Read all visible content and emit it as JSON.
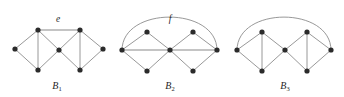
{
  "figure": {
    "width": 344,
    "height": 97,
    "background_color": "#ffffff",
    "edge_color": "#8c8c8c",
    "highlight_edge_color": "#b0b0b0",
    "vertex_color": "#2b2b2b",
    "label_color": "#262626"
  },
  "graphs": [
    {
      "id": "B1",
      "label": "B",
      "label_sub": "1",
      "label_x": 57,
      "label_y": 89,
      "vertices": [
        {
          "name": "b1-left",
          "x": 15,
          "y": 49
        },
        {
          "name": "b1-top-left",
          "x": 38,
          "y": 30
        },
        {
          "name": "b1-bottom-left",
          "x": 38,
          "y": 70
        },
        {
          "name": "b1-center",
          "x": 59,
          "y": 50
        },
        {
          "name": "b1-top-right",
          "x": 80,
          "y": 30
        },
        {
          "name": "b1-bottom-right",
          "x": 80,
          "y": 70
        },
        {
          "name": "b1-right",
          "x": 103,
          "y": 49
        }
      ],
      "edges": [
        {
          "from": 0,
          "to": 1,
          "kind": "line"
        },
        {
          "from": 0,
          "to": 2,
          "kind": "line"
        },
        {
          "from": 1,
          "to": 2,
          "kind": "line"
        },
        {
          "from": 1,
          "to": 3,
          "kind": "line"
        },
        {
          "from": 2,
          "to": 3,
          "kind": "line"
        },
        {
          "from": 3,
          "to": 4,
          "kind": "line"
        },
        {
          "from": 3,
          "to": 5,
          "kind": "line"
        },
        {
          "from": 4,
          "to": 5,
          "kind": "line"
        },
        {
          "from": 4,
          "to": 6,
          "kind": "line"
        },
        {
          "from": 5,
          "to": 6,
          "kind": "line"
        },
        {
          "from": 1,
          "to": 4,
          "kind": "highlight"
        }
      ],
      "edge_labels": [
        {
          "name": "edge-label-e",
          "text": "e",
          "x": 58,
          "y": 22
        }
      ],
      "arcs": []
    },
    {
      "id": "B2",
      "label": "B",
      "label_sub": "2",
      "label_x": 170,
      "label_y": 89,
      "vertices": [
        {
          "name": "b2-left",
          "x": 122,
          "y": 50
        },
        {
          "name": "b2-top-left",
          "x": 147,
          "y": 32
        },
        {
          "name": "b2-bottom-left",
          "x": 147,
          "y": 71
        },
        {
          "name": "b2-center",
          "x": 170,
          "y": 50
        },
        {
          "name": "b2-top-right",
          "x": 193,
          "y": 32
        },
        {
          "name": "b2-bottom-right",
          "x": 193,
          "y": 71
        },
        {
          "name": "b2-right",
          "x": 217,
          "y": 50
        }
      ],
      "edges": [
        {
          "from": 0,
          "to": 1,
          "kind": "line"
        },
        {
          "from": 0,
          "to": 2,
          "kind": "line"
        },
        {
          "from": 1,
          "to": 3,
          "kind": "line"
        },
        {
          "from": 2,
          "to": 3,
          "kind": "line"
        },
        {
          "from": 3,
          "to": 4,
          "kind": "line"
        },
        {
          "from": 3,
          "to": 5,
          "kind": "line"
        },
        {
          "from": 4,
          "to": 6,
          "kind": "line"
        },
        {
          "from": 5,
          "to": 6,
          "kind": "line"
        },
        {
          "from": 0,
          "to": 3,
          "kind": "highlight"
        },
        {
          "from": 3,
          "to": 6,
          "kind": "highlight"
        }
      ],
      "arcs": [
        {
          "name": "arc-edge-f",
          "from": 0,
          "to": 6,
          "rise": 44
        }
      ],
      "edge_labels": [
        {
          "name": "edge-label-f",
          "text": "f",
          "x": 170,
          "y": 22
        }
      ]
    },
    {
      "id": "B3",
      "label": "B",
      "label_sub": "3",
      "label_x": 285,
      "label_y": 89,
      "vertices": [
        {
          "name": "b3-left",
          "x": 237,
          "y": 50
        },
        {
          "name": "b3-top-left",
          "x": 262,
          "y": 32
        },
        {
          "name": "b3-bottom-left",
          "x": 262,
          "y": 71
        },
        {
          "name": "b3-center",
          "x": 285,
          "y": 50
        },
        {
          "name": "b3-top-right",
          "x": 307,
          "y": 32
        },
        {
          "name": "b3-bottom-right",
          "x": 307,
          "y": 71
        },
        {
          "name": "b3-right",
          "x": 331,
          "y": 50
        }
      ],
      "edges": [
        {
          "from": 0,
          "to": 1,
          "kind": "line"
        },
        {
          "from": 0,
          "to": 2,
          "kind": "line"
        },
        {
          "from": 1,
          "to": 2,
          "kind": "line"
        },
        {
          "from": 1,
          "to": 3,
          "kind": "line"
        },
        {
          "from": 2,
          "to": 3,
          "kind": "line"
        },
        {
          "from": 3,
          "to": 4,
          "kind": "line"
        },
        {
          "from": 3,
          "to": 5,
          "kind": "line"
        },
        {
          "from": 4,
          "to": 5,
          "kind": "line"
        },
        {
          "from": 4,
          "to": 6,
          "kind": "line"
        },
        {
          "from": 5,
          "to": 6,
          "kind": "line"
        }
      ],
      "arcs": [
        {
          "name": "arc-edge-b3",
          "from": 0,
          "to": 6,
          "rise": 44
        }
      ],
      "edge_labels": []
    }
  ]
}
